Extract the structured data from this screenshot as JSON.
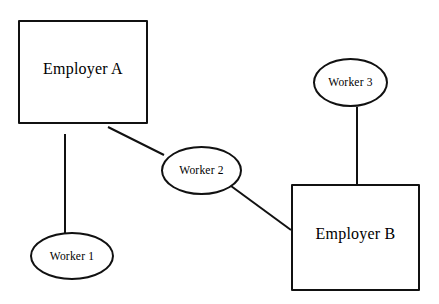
{
  "diagram": {
    "background_color": "#ffffff",
    "stroke_color": "#111111",
    "text_color": "#000000",
    "width": 439,
    "height": 304,
    "nodes": [
      {
        "id": "employer-a",
        "label": "Employer A",
        "shape": "rectangle",
        "x": 18,
        "y": 20,
        "width": 130,
        "height": 104
      },
      {
        "id": "employer-b",
        "label": "Employer B",
        "shape": "rectangle",
        "x": 291,
        "y": 184,
        "width": 129,
        "height": 107
      },
      {
        "id": "worker-1",
        "label": "Worker 1",
        "shape": "ellipse",
        "x": 30,
        "y": 232,
        "width": 84,
        "height": 48
      },
      {
        "id": "worker-2",
        "label": "Worker 2",
        "shape": "ellipse",
        "x": 161,
        "y": 146,
        "width": 81,
        "height": 49
      },
      {
        "id": "worker-3",
        "label": "Worker 3",
        "shape": "ellipse",
        "x": 313,
        "y": 58,
        "width": 75,
        "height": 49
      }
    ],
    "edges": [
      {
        "id": "edge-employer-a-worker-1",
        "from": "employer-a",
        "to": "worker-1",
        "x1": 65,
        "y1": 134,
        "x2": 65,
        "y2": 234
      },
      {
        "id": "edge-employer-a-worker-2",
        "from": "employer-a",
        "to": "worker-2",
        "x1": 108,
        "y1": 127,
        "x2": 164,
        "y2": 155
      },
      {
        "id": "edge-worker-2-employer-b",
        "from": "worker-2",
        "to": "employer-b",
        "x1": 231,
        "y1": 186,
        "x2": 291,
        "y2": 230
      },
      {
        "id": "edge-worker-3-employer-b",
        "from": "worker-3",
        "to": "employer-b",
        "x1": 357,
        "y1": 107,
        "x2": 357,
        "y2": 184
      }
    ]
  }
}
